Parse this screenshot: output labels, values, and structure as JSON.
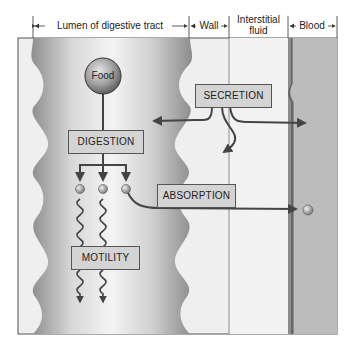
{
  "header": {
    "lumen": "Lumen of digestive tract",
    "wall": "Wall",
    "interstitial_line1": "Interstitial",
    "interstitial_line2": "fluid",
    "blood": "Blood"
  },
  "nodes": {
    "food": "Food",
    "digestion": "DIGESTION",
    "secretion": "SECRETION",
    "absorption": "ABSORPTION",
    "motility": "MOTILITY"
  },
  "colors": {
    "lumen_dark": "#8a8a8a",
    "lumen_light": "#f0f0f0",
    "wall": "#ededed",
    "interstitial": "#efefef",
    "blood": "#bdbdbd",
    "vessel_wall": "#8c8c8c",
    "box_fill": "#d4d4d4",
    "arrow": "#444444"
  }
}
